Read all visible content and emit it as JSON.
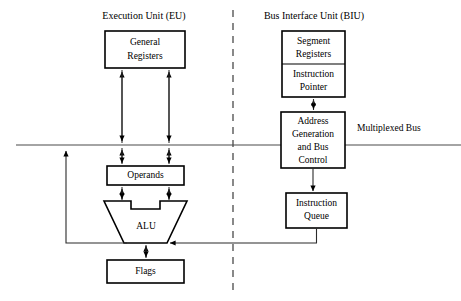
{
  "diagram": {
    "title_eu": "Execution Unit (EU)",
    "title_biu": "Bus Interface Unit (BIU)",
    "bus_label": "Multiplexed Bus",
    "blocks": {
      "general_registers_line1": "General",
      "general_registers_line2": "Registers",
      "segment_registers_line1": "Segment",
      "segment_registers_line2": "Registers",
      "instruction_pointer_line1": "Instruction",
      "instruction_pointer_line2": "Pointer",
      "address_generation_line1": "Address",
      "address_generation_line2": "Generation",
      "address_generation_line3": "and Bus",
      "address_generation_line4": "Control",
      "operands": "Operands",
      "alu": "ALU",
      "flags": "Flags",
      "instruction_queue_line1": "Instruction",
      "instruction_queue_line2": "Queue"
    },
    "colors": {
      "stroke": "#000000",
      "connector": "#2b2b2b",
      "bus": "#4a4a4a",
      "background": "#ffffff"
    }
  }
}
